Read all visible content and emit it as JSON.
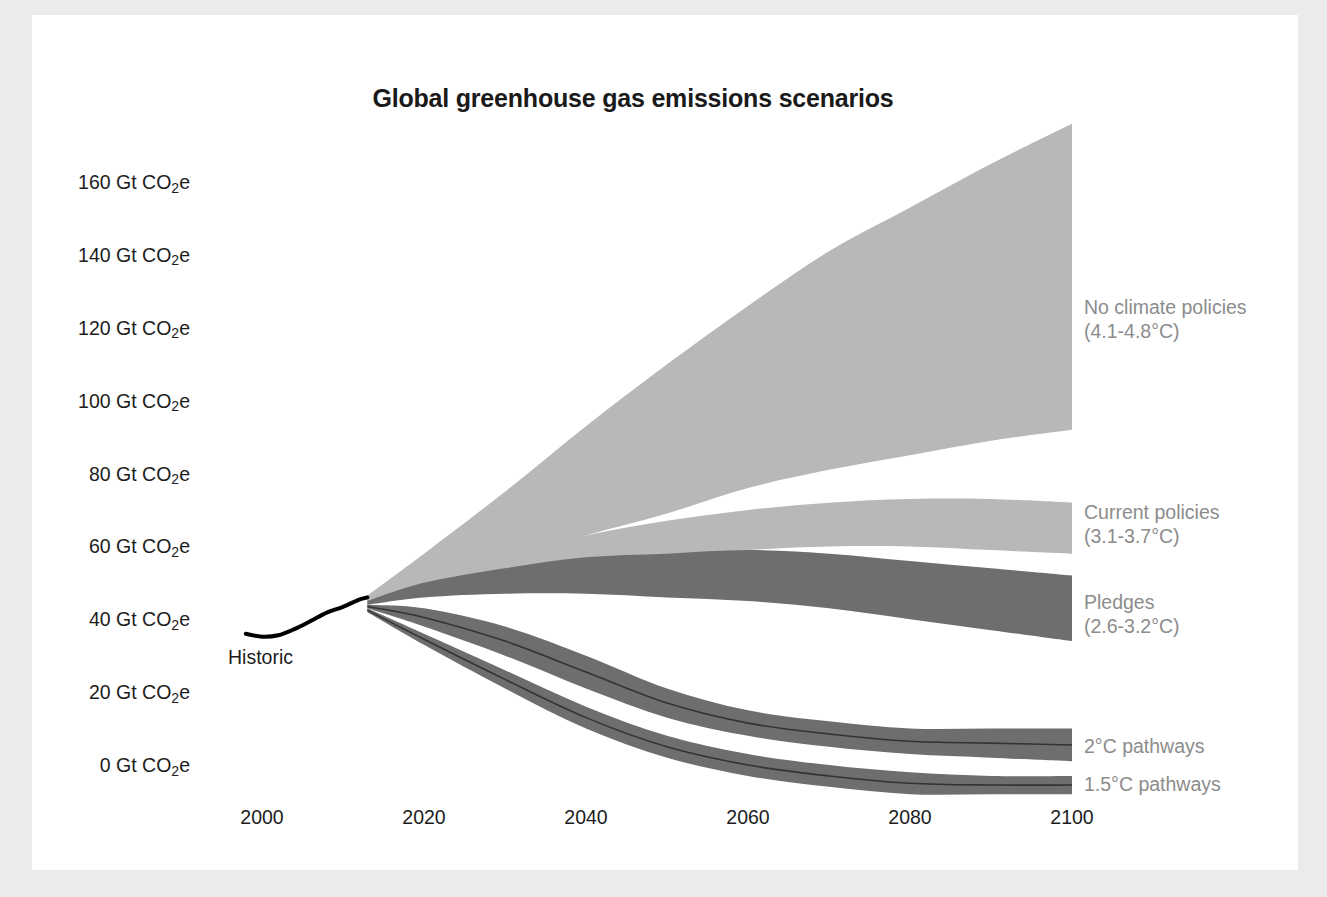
{
  "figure": {
    "title": "Global greenhouse gas emissions scenarios",
    "background_color": "#ffffff",
    "page_background_color": "#ebebeb"
  },
  "axes": {
    "y_tick_labels": [
      "160 Gt CO|2|e",
      "140 Gt CO|2|e",
      "120 Gt CO|2|e",
      "100 Gt CO|2|e",
      "80 Gt CO|2|e",
      "60 Gt CO|2|e",
      "40 Gt CO|2|e",
      "20 Gt CO|2|e",
      "0 Gt CO|2|e"
    ],
    "y_tick_values": [
      160,
      140,
      120,
      100,
      80,
      60,
      40,
      20,
      0
    ],
    "x_tick_labels": [
      "2000",
      "2020",
      "2040",
      "2060",
      "2080",
      "2100"
    ],
    "x_tick_values": [
      2000,
      2020,
      2040,
      2060,
      2080,
      2100
    ]
  },
  "annotations": {
    "historic_label": "Historic"
  },
  "series_labels": [
    {
      "name": "no-climate-policies",
      "line1": "No climate policies",
      "line2": "(4.1-4.8°C)",
      "color": "#8c8c8c"
    },
    {
      "name": "current-policies",
      "line1": "Current policies",
      "line2": "(3.1-3.7°C)",
      "color": "#8c8c8c"
    },
    {
      "name": "pledges",
      "line1": "Pledges",
      "line2": "(2.6-3.2°C)",
      "color": "#8c8c8c"
    },
    {
      "name": "two-degree-pathways",
      "line1": "2°C pathways",
      "line2": "",
      "color": "#8c8c8c"
    },
    {
      "name": "one-point-five-degree-pathways",
      "line1": "1.5°C pathways",
      "line2": "",
      "color": "#8c8c8c"
    }
  ],
  "chart_data": {
    "type": "area",
    "title": "Global greenhouse gas emissions scenarios",
    "xlabel": "",
    "ylabel": "Gt CO2e",
    "xlim": [
      1995,
      2100
    ],
    "ylim": [
      -8,
      180
    ],
    "grid": false,
    "legend_position": "right-inline",
    "unit": "Gt CO2e",
    "colors": {
      "band_light": "#b8b8b8",
      "band_dark": "#6e6e6e",
      "historic_line": "#000000",
      "median_line": "#333333",
      "label_gray": "#8c8c8c"
    },
    "historic": {
      "name": "Historic",
      "x": [
        1998,
        2000,
        2002,
        2004,
        2006,
        2008,
        2010,
        2012,
        2013
      ],
      "y": [
        36.0,
        35.2,
        35.6,
        37.3,
        39.5,
        41.8,
        43.4,
        45.4,
        46.0
      ]
    },
    "series": [
      {
        "name": "No climate policies",
        "temperature_range": "4.1-4.8°C",
        "color": "#b8b8b8",
        "x": [
          2013,
          2020,
          2030,
          2040,
          2050,
          2060,
          2070,
          2080,
          2090,
          2100
        ],
        "upper": [
          46.5,
          58,
          75,
          93,
          110,
          126,
          141,
          153,
          165,
          176
        ],
        "lower": [
          45.0,
          50,
          56,
          63,
          69,
          76,
          81,
          85,
          89,
          92
        ]
      },
      {
        "name": "Current policies",
        "temperature_range": "3.1-3.7°C",
        "color": "#b8b8b8",
        "x": [
          2013,
          2020,
          2030,
          2040,
          2050,
          2060,
          2070,
          2080,
          2090,
          2100
        ],
        "upper": [
          45.5,
          52,
          58,
          63,
          67,
          70,
          72,
          73,
          73,
          72
        ],
        "lower": [
          44.5,
          48,
          52,
          55,
          57,
          59,
          60,
          60,
          59,
          58
        ]
      },
      {
        "name": "Pledges",
        "temperature_range": "2.6-3.2°C",
        "color": "#6e6e6e",
        "x": [
          2013,
          2020,
          2030,
          2040,
          2050,
          2060,
          2070,
          2080,
          2090,
          2100
        ],
        "upper": [
          45.0,
          50,
          54,
          57,
          58,
          59,
          58,
          56,
          54,
          52
        ],
        "lower": [
          44.0,
          46,
          47,
          47,
          46,
          45,
          43,
          40,
          37,
          34
        ]
      },
      {
        "name": "2°C pathways",
        "temperature_range": "2°C",
        "color": "#6e6e6e",
        "x": [
          2013,
          2020,
          2030,
          2040,
          2050,
          2060,
          2070,
          2080,
          2090,
          2100
        ],
        "upper": [
          44.0,
          43,
          38,
          30,
          21,
          15,
          12,
          10,
          10,
          10
        ],
        "lower": [
          43.0,
          38,
          30,
          21,
          13,
          8,
          5,
          3,
          2,
          1
        ],
        "median": [
          43.5,
          40.5,
          34,
          25.5,
          17,
          11.5,
          8.5,
          6.5,
          6,
          5.5
        ]
      },
      {
        "name": "1.5°C pathways",
        "temperature_range": "1.5°C",
        "color": "#6e6e6e",
        "x": [
          2013,
          2020,
          2030,
          2040,
          2050,
          2060,
          2070,
          2080,
          2090,
          2100
        ],
        "upper": [
          43.0,
          36,
          26,
          16,
          8,
          3,
          0,
          -2,
          -3,
          -3
        ],
        "lower": [
          42.0,
          33,
          21,
          10,
          2,
          -3,
          -6,
          -8,
          -8,
          -8
        ],
        "median": [
          42.5,
          34.5,
          23.5,
          13,
          5,
          0,
          -3,
          -5,
          -5.5,
          -5.5
        ]
      }
    ]
  }
}
